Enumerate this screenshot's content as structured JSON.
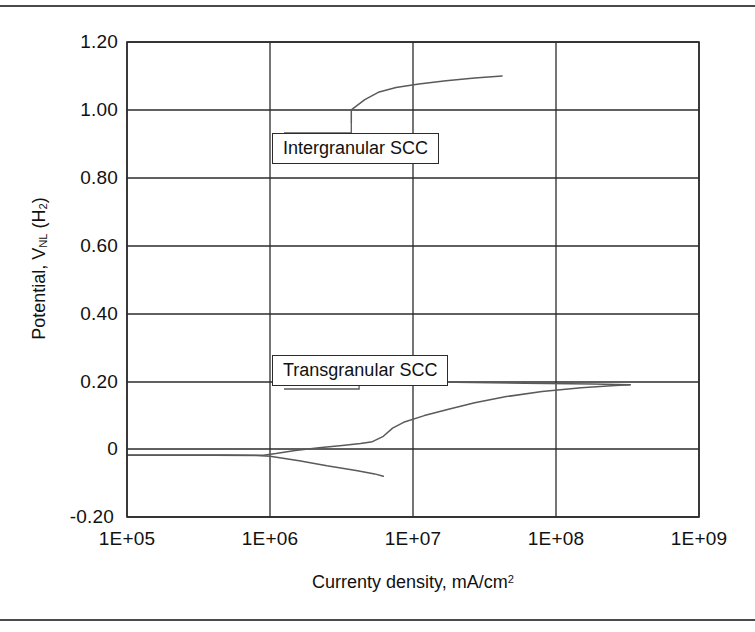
{
  "figure": {
    "background": "#ffffff",
    "rule_color": "#4a4a4a"
  },
  "chart_data": {
    "type": "line",
    "title": "",
    "subtitle": "",
    "xlabel": "Currenty density, mA/cm²",
    "ylabel": "Potential, Vₙₗ (H₂)",
    "ylabel_parts": {
      "prefix": "Potential, V",
      "subscript": "NL",
      "suffix": " (H",
      "sub2": "2",
      "close": ")"
    },
    "xlabel_parts": {
      "prefix": "Currenty density, mA/cm",
      "superscript": "2"
    },
    "xscale": "log",
    "xlim": [
      100000,
      1000000000
    ],
    "ylim": [
      -0.2,
      1.2
    ],
    "grid": true,
    "grid_x": true,
    "grid_y": true,
    "legend": "none",
    "xticks": [
      100000,
      1000000,
      10000000,
      100000000,
      1000000000
    ],
    "xtick_labels": [
      "1E+05",
      "1E+06",
      "1E+07",
      "1E+08",
      "1E+09"
    ],
    "yticks": [
      -0.2,
      0,
      0.2,
      0.4,
      0.6,
      0.8,
      1.0,
      1.2
    ],
    "ytick_labels": [
      "-0.20",
      "0",
      "0.20",
      "0.40",
      "0.60",
      "0.80",
      "1.00",
      "1.20"
    ],
    "line_color": "#4f4f4f",
    "axis_color": "#2b2b2b",
    "series": [
      {
        "name": "cathodic-branch",
        "points": [
          [
            100000,
            -0.018
          ],
          [
            400000,
            -0.018
          ],
          [
            800000,
            -0.019
          ],
          [
            1000000,
            -0.021
          ],
          [
            1600000,
            -0.034
          ],
          [
            2500000,
            -0.049
          ],
          [
            4000000,
            -0.063
          ],
          [
            5400000,
            -0.073
          ],
          [
            6200000,
            -0.08
          ]
        ]
      },
      {
        "name": "anodic-branch-transgranular",
        "points": [
          [
            100000,
            -0.017
          ],
          [
            500000,
            -0.017
          ],
          [
            900000,
            -0.018
          ],
          [
            1100000,
            -0.013
          ],
          [
            1500000,
            -0.004
          ],
          [
            2200000,
            0.004
          ],
          [
            3200000,
            0.011
          ],
          [
            4300000,
            0.017
          ],
          [
            5200000,
            0.022
          ],
          [
            6200000,
            0.038
          ],
          [
            7200000,
            0.062
          ],
          [
            8600000,
            0.079
          ],
          [
            12000000,
            0.099
          ],
          [
            18000000,
            0.118
          ],
          [
            27000000,
            0.137
          ],
          [
            45000000,
            0.155
          ],
          [
            80000000,
            0.17
          ],
          [
            150000000,
            0.181
          ],
          [
            260000000,
            0.188
          ],
          [
            330000000,
            0.19
          ]
        ]
      },
      {
        "name": "passive-plateau",
        "points": [
          [
            4200000,
            0.201
          ],
          [
            7000000,
            0.2
          ],
          [
            20000000,
            0.197
          ],
          [
            60000000,
            0.194
          ],
          [
            180000000,
            0.192
          ],
          [
            330000000,
            0.19
          ]
        ]
      },
      {
        "name": "intergranular-branch",
        "points": [
          [
            3700000,
            0.963
          ],
          [
            3700000,
            1.0
          ],
          [
            4600000,
            1.03
          ],
          [
            5800000,
            1.053
          ],
          [
            7600000,
            1.066
          ],
          [
            11000000,
            1.076
          ],
          [
            17000000,
            1.086
          ],
          [
            27000000,
            1.094
          ],
          [
            42000000,
            1.1
          ]
        ]
      }
    ],
    "annotations": [
      {
        "id": "intergranular",
        "text": "Intergranular SCC",
        "box": {
          "x": 272,
          "y": 133,
          "w": 185,
          "h": 34
        },
        "leader": "from curve start down to box top"
      },
      {
        "id": "transgranular",
        "text": "Transgranular SCC",
        "box": {
          "x": 272,
          "y": 355,
          "w": 190,
          "h": 34
        },
        "leader": "from box bottom down to passive plateau"
      }
    ]
  }
}
